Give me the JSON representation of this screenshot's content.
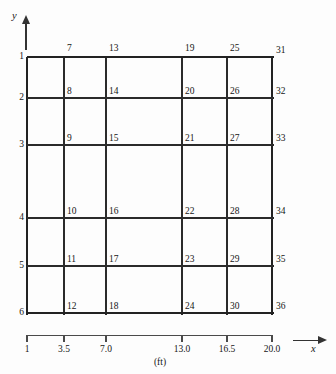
{
  "figure": {
    "title": "",
    "unit_label": "(ft)",
    "line_color": "#2b2b2b",
    "background": "#fdfdfd"
  },
  "axes": {
    "y_letter": "y",
    "x_letter": "x"
  },
  "chart_data": {
    "type": "table",
    "title": "",
    "xlabel": "(ft)",
    "ylabel": "",
    "grid": true,
    "legend": "none",
    "x_ticks": [
      "1",
      "3.5",
      "7.0",
      "13.0",
      "16.5",
      "20.0"
    ],
    "x_tick_values": [
      1,
      3.5,
      7.0,
      13.0,
      16.5,
      20.0
    ],
    "y_ticks": [
      "1",
      "2",
      "3",
      "4",
      "5",
      "6"
    ],
    "y_tick_values": [
      1,
      2,
      3,
      4,
      5,
      6
    ],
    "xlim": [
      1,
      20.0
    ],
    "ylim": [
      1,
      6
    ],
    "columns_px": [
      27,
      64,
      106,
      182,
      227,
      272
    ],
    "rows_px": [
      57,
      98,
      145,
      218,
      266,
      313
    ],
    "node_numbering": "column-major, 6 nodes per column, 36 nodes total",
    "nodes": [
      {
        "id": "1",
        "col": 0,
        "row": 0,
        "place": "left"
      },
      {
        "id": "2",
        "col": 0,
        "row": 1,
        "place": "left"
      },
      {
        "id": "3",
        "col": 0,
        "row": 2,
        "place": "left"
      },
      {
        "id": "4",
        "col": 0,
        "row": 3,
        "place": "left"
      },
      {
        "id": "5",
        "col": 0,
        "row": 4,
        "place": "left"
      },
      {
        "id": "6",
        "col": 0,
        "row": 5,
        "place": "left"
      },
      {
        "id": "7",
        "col": 1,
        "row": 0,
        "place": "top"
      },
      {
        "id": "8",
        "col": 1,
        "row": 1,
        "place": "inner"
      },
      {
        "id": "9",
        "col": 1,
        "row": 2,
        "place": "inner"
      },
      {
        "id": "10",
        "col": 1,
        "row": 3,
        "place": "inner"
      },
      {
        "id": "11",
        "col": 1,
        "row": 4,
        "place": "inner"
      },
      {
        "id": "12",
        "col": 1,
        "row": 5,
        "place": "inner"
      },
      {
        "id": "13",
        "col": 2,
        "row": 0,
        "place": "top"
      },
      {
        "id": "14",
        "col": 2,
        "row": 1,
        "place": "inner"
      },
      {
        "id": "15",
        "col": 2,
        "row": 2,
        "place": "inner"
      },
      {
        "id": "16",
        "col": 2,
        "row": 3,
        "place": "inner"
      },
      {
        "id": "17",
        "col": 2,
        "row": 4,
        "place": "inner"
      },
      {
        "id": "18",
        "col": 2,
        "row": 5,
        "place": "inner"
      },
      {
        "id": "19",
        "col": 3,
        "row": 0,
        "place": "top"
      },
      {
        "id": "20",
        "col": 3,
        "row": 1,
        "place": "inner"
      },
      {
        "id": "21",
        "col": 3,
        "row": 2,
        "place": "inner"
      },
      {
        "id": "22",
        "col": 3,
        "row": 3,
        "place": "inner"
      },
      {
        "id": "23",
        "col": 3,
        "row": 4,
        "place": "inner"
      },
      {
        "id": "24",
        "col": 3,
        "row": 5,
        "place": "inner"
      },
      {
        "id": "25",
        "col": 4,
        "row": 0,
        "place": "top"
      },
      {
        "id": "26",
        "col": 4,
        "row": 1,
        "place": "inner"
      },
      {
        "id": "27",
        "col": 4,
        "row": 2,
        "place": "inner"
      },
      {
        "id": "28",
        "col": 4,
        "row": 3,
        "place": "inner"
      },
      {
        "id": "29",
        "col": 4,
        "row": 4,
        "place": "inner"
      },
      {
        "id": "30",
        "col": 4,
        "row": 5,
        "place": "inner"
      },
      {
        "id": "31",
        "col": 5,
        "row": 0,
        "place": "right"
      },
      {
        "id": "32",
        "col": 5,
        "row": 1,
        "place": "right"
      },
      {
        "id": "33",
        "col": 5,
        "row": 2,
        "place": "right"
      },
      {
        "id": "34",
        "col": 5,
        "row": 3,
        "place": "right"
      },
      {
        "id": "35",
        "col": 5,
        "row": 4,
        "place": "right"
      },
      {
        "id": "36",
        "col": 5,
        "row": 5,
        "place": "right"
      }
    ]
  }
}
